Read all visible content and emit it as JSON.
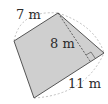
{
  "diagram": {
    "type": "quadrilateral",
    "fill_color": "#cfcfcf",
    "stroke_color": "#555555",
    "dashed_color": "#9a9a9a",
    "labels": {
      "side_top": "7 m",
      "height": "8 m",
      "side_bottom": "11 m"
    }
  }
}
